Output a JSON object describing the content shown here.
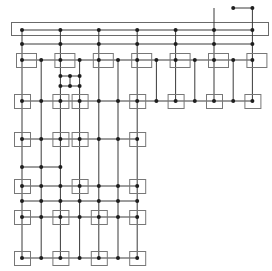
{
  "diagram": {
    "type": "grid-graph",
    "colors": {
      "wire": "#3a3a3a",
      "frame": "#6a6a6a",
      "box": "#777777",
      "node": "#1e1e1e"
    },
    "columns": [
      "c0",
      "c1",
      "c2",
      "c3",
      "c4",
      "c5",
      "c6",
      "c7",
      "c8",
      "c9",
      "c10",
      "c11",
      "c12"
    ],
    "rows": [
      "top-bracket",
      "bus-a",
      "bus-b",
      "r1",
      "sub-a",
      "sub-b",
      "r2",
      "r3",
      "mid",
      "r4",
      "link",
      "r5",
      "r6"
    ],
    "bus_frame": {
      "from_col": "c0",
      "to_col": "c12"
    },
    "buses": [
      {
        "row": "top-bracket",
        "from": 11,
        "to": 12,
        "nodes": [
          11,
          12
        ]
      },
      {
        "row": "bus-a",
        "from": 0,
        "to": 12,
        "nodes": [
          0,
          2,
          4,
          6,
          8,
          10,
          12
        ]
      },
      {
        "row": "bus-b",
        "from": 0,
        "to": 12,
        "nodes": [
          0,
          2,
          4,
          6,
          8,
          10,
          12
        ]
      },
      {
        "row": "r1",
        "from": 0,
        "to": 12,
        "nodes": [
          0,
          1,
          2,
          3,
          4,
          5,
          6,
          7,
          8,
          9,
          10,
          11,
          12
        ],
        "boxes": [
          0,
          2,
          4,
          6,
          8,
          10,
          12
        ]
      },
      {
        "row": "r2",
        "from": 0,
        "to": 12,
        "nodes": [
          0,
          1,
          2,
          3,
          4,
          5,
          6,
          7,
          8,
          9,
          10,
          11,
          12
        ],
        "boxes": [
          0,
          2,
          3,
          6,
          8,
          10,
          12
        ]
      },
      {
        "row": "r3",
        "from": 0,
        "to": 6,
        "nodes": [
          0,
          1,
          2,
          3,
          4,
          5,
          6
        ],
        "boxes": [
          0,
          2,
          3,
          6
        ]
      },
      {
        "row": "mid",
        "from": 0,
        "to": 2,
        "nodes": [
          0,
          1,
          2
        ]
      },
      {
        "row": "r4",
        "from": 0,
        "to": 6,
        "nodes": [
          0,
          1,
          2,
          3,
          4,
          5,
          6
        ],
        "boxes": [
          0,
          3,
          6
        ]
      },
      {
        "row": "link",
        "from": 0,
        "to": 6,
        "nodes": [
          0,
          1,
          2,
          3,
          4,
          5,
          6
        ]
      },
      {
        "row": "r5",
        "from": 0,
        "to": 6,
        "nodes": [
          0,
          1,
          2,
          3,
          4,
          5,
          6
        ],
        "boxes": [
          0,
          2,
          4,
          6
        ]
      },
      {
        "row": "r6",
        "from": 0,
        "to": 6,
        "nodes": [
          0,
          1,
          2,
          3,
          4,
          5,
          6
        ],
        "boxes": [
          0,
          2,
          4,
          6
        ]
      }
    ],
    "verticals": [
      {
        "col": 0,
        "from": "bus-a",
        "to": "r6"
      },
      {
        "col": 1,
        "from": "r1",
        "to": "r6"
      },
      {
        "col": 2,
        "from": "bus-a",
        "to": "r6"
      },
      {
        "col": 3,
        "from": "r1",
        "to": "r6"
      },
      {
        "col": 4,
        "from": "bus-a",
        "to": "r6"
      },
      {
        "col": 5,
        "from": "r1",
        "to": "r6"
      },
      {
        "col": 6,
        "from": "bus-a",
        "to": "r6"
      },
      {
        "col": 7,
        "from": "r1",
        "to": "r2"
      },
      {
        "col": 8,
        "from": "bus-a",
        "to": "r2"
      },
      {
        "col": 9,
        "from": "r1",
        "to": "r2"
      },
      {
        "col": 10,
        "from": "top-bracket",
        "to": "r2"
      },
      {
        "col": 11,
        "from": "r1",
        "to": "r2"
      },
      {
        "col": 12,
        "from": "top-bracket",
        "to": "r2"
      }
    ],
    "subgrid": {
      "rows": [
        "sub-a",
        "sub-b"
      ],
      "cols": [
        2,
        2.5,
        3
      ]
    }
  }
}
